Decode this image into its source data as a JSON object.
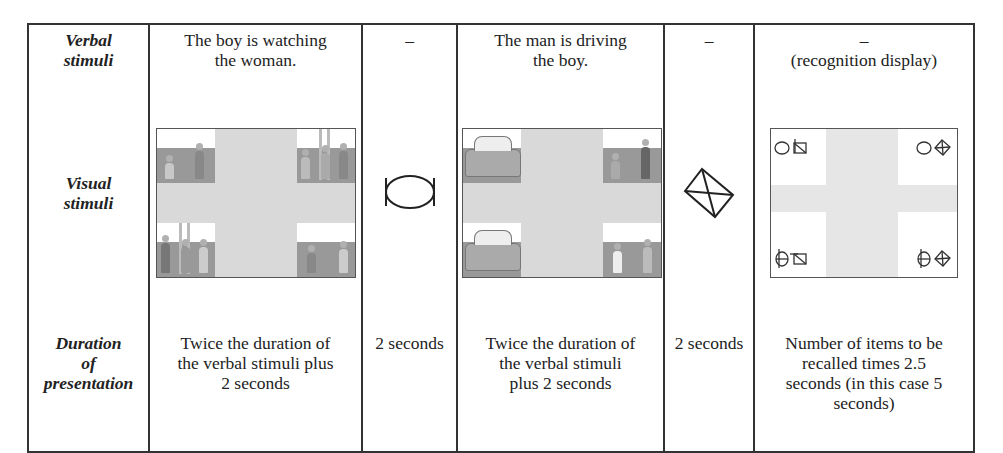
{
  "table": {
    "rows": [
      {
        "header": [
          "Verbal",
          "stimuli"
        ],
        "cells": [
          [
            "The boy is watching",
            "the woman."
          ],
          [
            "–"
          ],
          [
            "The man is driving",
            "the boy."
          ],
          [
            "–"
          ],
          [
            "–",
            "(recognition display)"
          ]
        ]
      },
      {
        "header": [
          "Visual",
          "stimuli"
        ],
        "cells": [
          {
            "type": "picture-array",
            "icon": "scene-watching-image"
          },
          {
            "type": "symbol",
            "icon": "ellipse-with-bars-icon"
          },
          {
            "type": "picture-array",
            "icon": "scene-driving-image"
          },
          {
            "type": "symbol",
            "icon": "crossed-diamond-icon"
          },
          {
            "type": "recognition-array",
            "icon": "symbol-pairs-image"
          }
        ]
      },
      {
        "header": [
          "Duration",
          "of",
          "presentation"
        ],
        "cells": [
          [
            "Twice the duration of",
            "the verbal stimuli plus",
            "2 seconds"
          ],
          [
            "2 seconds"
          ],
          [
            "Twice the duration of",
            "the verbal stimuli",
            "plus 2 seconds"
          ],
          [
            "2 seconds"
          ],
          [
            "Number of items to be",
            "recalled times 2.5",
            "seconds (in this case 5",
            "seconds)"
          ]
        ]
      }
    ]
  },
  "colors": {
    "border": "#333333",
    "cross_background": "#d9d9d9",
    "floor": "#999999"
  }
}
